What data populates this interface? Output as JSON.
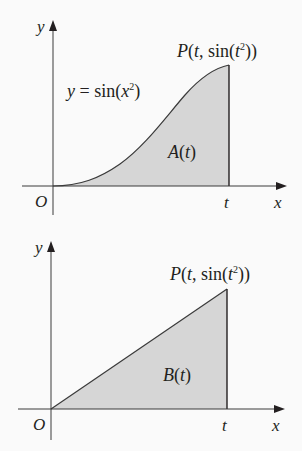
{
  "colors": {
    "background": "#fafafa",
    "shade": "#d6d6d6",
    "ink": "#231f20",
    "axis": "#3a3a3a"
  },
  "top_figure": {
    "axis_y_label": "y",
    "axis_x_label": "x",
    "origin_label": "O",
    "t_label": "t",
    "point_label": {
      "prefix": "P",
      "open": "(",
      "t": "t",
      "comma_sin": ", sin(",
      "t2": "t",
      "exp": "2",
      "close": "))"
    },
    "curve_label": {
      "lhs": "y",
      "eq": " = sin(",
      "var": "x",
      "exp": "2",
      "close": ")"
    },
    "area_label": {
      "name": "A",
      "open": "(",
      "var": "t",
      "close": ")"
    }
  },
  "bottom_figure": {
    "axis_y_label": "y",
    "axis_x_label": "x",
    "origin_label": "O",
    "t_label": "t",
    "point_label": {
      "prefix": "P",
      "open": "(",
      "t": "t",
      "comma_sin": ", sin(",
      "t2": "t",
      "exp": "2",
      "close": "))"
    },
    "area_label": {
      "name": "B",
      "open": "(",
      "var": "t",
      "close": ")"
    }
  }
}
